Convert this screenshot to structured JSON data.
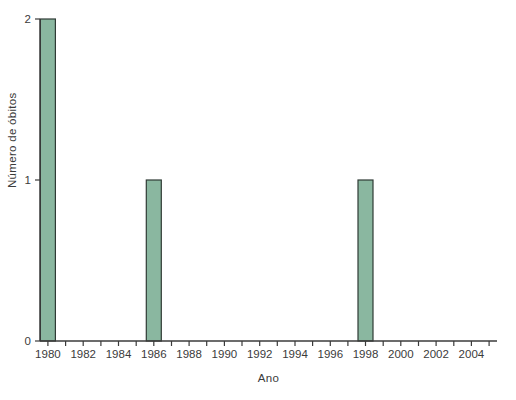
{
  "chart_data": {
    "type": "bar",
    "title": "",
    "xlabel": "Ano",
    "ylabel": "Número de óbitos",
    "categories": [
      1980,
      1986,
      1998
    ],
    "values": [
      2,
      1,
      1
    ],
    "xlim": [
      1979.55,
      2005.45
    ],
    "ylim": [
      0,
      2
    ],
    "yticks": [
      0,
      1,
      2
    ],
    "xticks_minor": [
      1980,
      1981,
      1982,
      1983,
      1984,
      1985,
      1986,
      1987,
      1988,
      1989,
      1990,
      1991,
      1992,
      1993,
      1994,
      1995,
      1996,
      1997,
      1998,
      1999,
      2000,
      2001,
      2002,
      2003,
      2004,
      2005
    ],
    "xticks_labeled": [
      1980,
      1982,
      1984,
      1986,
      1988,
      1990,
      1992,
      1994,
      1996,
      1998,
      2000,
      2002,
      2004
    ],
    "bar_width_years": 0.85,
    "grid": false,
    "legend": null,
    "colors": {
      "bar_fill": "#8ab7a0",
      "bar_edge": "#2f3b35",
      "axis": "#3b3b3b",
      "text": "#3b3b3b",
      "background": "#ffffff"
    }
  }
}
